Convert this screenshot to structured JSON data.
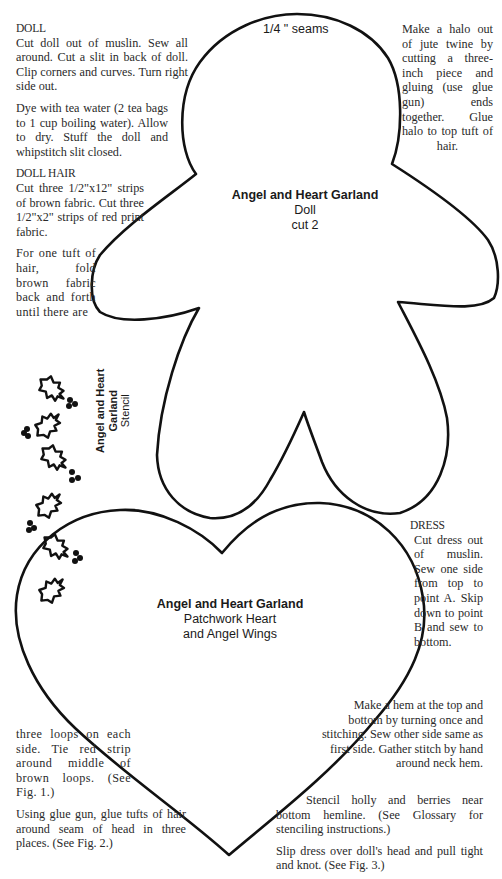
{
  "doll_pattern": {
    "seam_note": "1/4 \" seams",
    "title": "Angel and Heart Garland",
    "subtitle": "Doll",
    "cut_note": "cut 2"
  },
  "heart_pattern": {
    "title": "Angel and Heart Garland",
    "line1": "Patchwork Heart",
    "line2": "and Angel Wings"
  },
  "stencil": {
    "line1": "Angel and Heart",
    "line2": "Garland",
    "line3": "Stencil",
    "leaf_count": 6,
    "berry_cluster_count": 5
  },
  "instructions": {
    "doll": {
      "heading": "DOLL",
      "para1": "Cut doll out of muslin. Sew all around. Cut a slit in back of doll. Clip corners and curves. Turn right side out.",
      "para2": "Dye with tea water (2 tea bags to 1 cup boiling water). Allow to dry. Stuff the doll and whipstitch slit closed."
    },
    "doll_hair": {
      "heading": "DOLL HAIR",
      "para1": "Cut three 1/2\"x12\" strips of brown fabric. Cut three 1/2\"x2\" strips of red print fabric.",
      "para2_start": "For one tuft of hair, fold brown fabric back and forth until there are",
      "para2_end": "three loops on each side. Tie red strip around middle of brown loops. (See Fig. 1.)",
      "para3": "Using glue gun, glue tufts of hair around seam of head in three places. (See Fig. 2.)"
    },
    "halo": {
      "para": "Make a halo out of jute twine by cutting a three-inch piece and gluing (use glue gun) ends together. Glue halo to top tuft of hair."
    },
    "dress": {
      "heading": "DRESS",
      "para1": "Cut dress out of muslin. Sew one side from top to point A. Skip down to point B and sew to bottom.",
      "para2": "Make a hem at the top and bottom by turning once and stitching. Sew other side same as first side. Gather stitch by hand around neck hem.",
      "para3": "Stencil holly and berries near bottom hemline. (See Glossary for stenciling instructions.)",
      "para4": "Slip dress over doll's head and pull tight and knot. (See Fig. 3.)"
    }
  },
  "colors": {
    "outline": "#111111",
    "text": "#2a2a2a",
    "background": "#ffffff"
  }
}
